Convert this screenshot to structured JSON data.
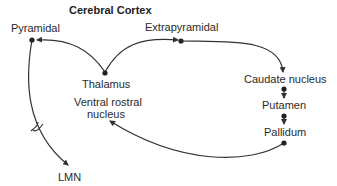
{
  "title": "Cerebral Cortex",
  "nodes": {
    "pyramidal": "Pyramidal",
    "extrapyramidal": "Extrapyramidal",
    "thalamus": "Thalamus",
    "caudate": "Caudate nucleus",
    "putamen": "Putamen",
    "pallidum": "Pallidum",
    "ventral_rostral_line1": "Ventral rostral",
    "ventral_rostral_line2": "nucleus",
    "lmn": "LMN"
  },
  "colors": {
    "line": "#333333",
    "dot": "#222222"
  }
}
